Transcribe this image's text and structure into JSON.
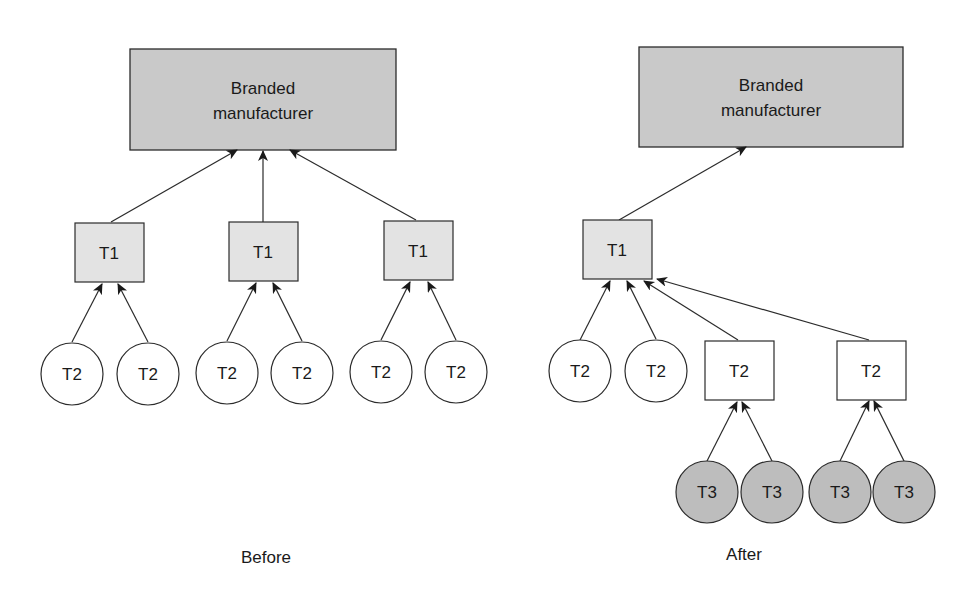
{
  "colors": {
    "background": "#ffffff",
    "stroke": "#2b2b2b",
    "manufacturer_fill": "#c9c9c9",
    "t1_fill": "#e3e3e3",
    "t2_fill": "#ffffff",
    "t3_fill": "#bdbdbd"
  },
  "before": {
    "caption": "Before",
    "manufacturer": {
      "line1": "Branded",
      "line2": "manufacturer"
    },
    "t1": [
      {
        "label": "T1"
      },
      {
        "label": "T1"
      },
      {
        "label": "T1"
      }
    ],
    "t2": [
      {
        "label": "T2"
      },
      {
        "label": "T2"
      },
      {
        "label": "T2"
      },
      {
        "label": "T2"
      },
      {
        "label": "T2"
      },
      {
        "label": "T2"
      }
    ]
  },
  "after": {
    "caption": "After",
    "manufacturer": {
      "line1": "Branded",
      "line2": "manufacturer"
    },
    "t1": [
      {
        "label": "T1"
      }
    ],
    "t2_circles": [
      {
        "label": "T2"
      },
      {
        "label": "T2"
      }
    ],
    "t2_boxes": [
      {
        "label": "T2"
      },
      {
        "label": "T2"
      }
    ],
    "t3": [
      {
        "label": "T3"
      },
      {
        "label": "T3"
      },
      {
        "label": "T3"
      },
      {
        "label": "T3"
      }
    ]
  }
}
